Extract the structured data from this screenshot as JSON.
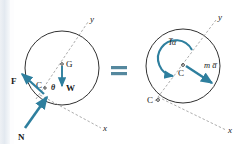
{
  "figure": {
    "equals_sign": "=",
    "accent_color": "#2e7f9e",
    "line_color": "#1a1a1a",
    "axis_color": "#777777"
  },
  "left_diagram": {
    "name": "free-body-diagram",
    "axis_y_label": "y",
    "axis_x_label": "x",
    "center_label": "G",
    "contact_label": "C",
    "angle_label": "θ",
    "weight_label": "W",
    "friction_label": "F",
    "normal_label": "N",
    "vectors": [
      {
        "name": "weight",
        "label": "W",
        "direction": "down"
      },
      {
        "name": "friction",
        "label": "F",
        "direction": "up-left"
      },
      {
        "name": "normal",
        "label": "N",
        "direction": "up-right"
      }
    ]
  },
  "right_diagram": {
    "name": "kinetic-diagram",
    "axis_y_label": "y",
    "axis_x_label": "x",
    "center_label": "C",
    "contact_label": "C",
    "moment_label": "I̅α",
    "force_label": "m a̅",
    "vectors": [
      {
        "name": "angular-moment",
        "label": "I̅α",
        "direction": "counterclockwise-arc"
      },
      {
        "name": "mass-acceleration",
        "label": "m a̅",
        "direction": "down-right"
      }
    ]
  }
}
